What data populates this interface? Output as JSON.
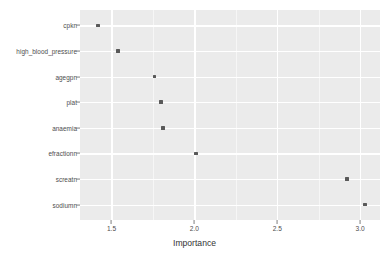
{
  "chart_data": {
    "type": "scatter",
    "title": "",
    "xlabel": "Importance",
    "ylabel": "",
    "xlim": [
      1.31,
      3.12
    ],
    "grid": true,
    "legend": false,
    "orientation": "horizontal-dot-plot",
    "categories": [
      "sodiumn",
      "screatn",
      "efractionn",
      "anaemia",
      "plat",
      "agegpn",
      "high_blood_pressure",
      "cpkn"
    ],
    "values": [
      3.03,
      2.92,
      2.01,
      1.81,
      1.8,
      1.76,
      1.54,
      1.42
    ],
    "points": [
      {
        "category": "sodiumn",
        "importance": 3.03
      },
      {
        "category": "screatn",
        "importance": 2.92
      },
      {
        "category": "efractionn",
        "importance": 2.01
      },
      {
        "category": "anaemia",
        "importance": 1.81
      },
      {
        "category": "plat",
        "importance": 1.8
      },
      {
        "category": "agegpn",
        "importance": 1.76
      },
      {
        "category": "high_blood_pressure",
        "importance": 1.54
      },
      {
        "category": "cpkn",
        "importance": 1.42
      }
    ],
    "x_ticks": [
      {
        "value": 1.5,
        "label": "1.5"
      },
      {
        "value": 2.0,
        "label": "2.0"
      },
      {
        "value": 2.5,
        "label": "2.5"
      },
      {
        "value": 3.0,
        "label": "3.0"
      }
    ],
    "x_minor_ticks": [
      1.25,
      1.75,
      2.25,
      2.75,
      3.25
    ],
    "colors": {
      "panel_background": "#ebebeb",
      "gridline_major": "#ffffff",
      "gridline_minor": "#f6f6f6",
      "point": "#595959",
      "axis_text": "#4d4d4d",
      "axis_title": "#333333",
      "page_background": "#ffffff"
    }
  }
}
